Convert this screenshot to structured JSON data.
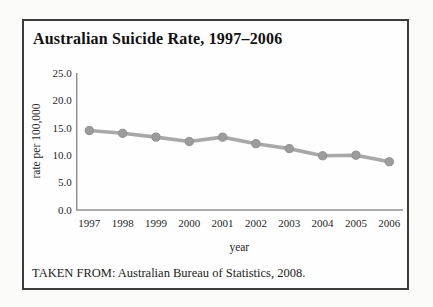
{
  "figure": {
    "title": "Australian Suicide Rate, 1997–2006",
    "caption": "TAKEN FROM: Australian Bureau of Statistics, 2008."
  },
  "chart_data": {
    "type": "line",
    "title": "Australian Suicide Rate, 1997–2006",
    "xlabel": "year",
    "ylabel": "rate per 100,000",
    "categories": [
      "1997",
      "1998",
      "1999",
      "2000",
      "2001",
      "2002",
      "2003",
      "2004",
      "2005",
      "2006"
    ],
    "values": [
      14.5,
      14.0,
      13.3,
      12.5,
      13.3,
      12.1,
      11.2,
      9.9,
      10.0,
      8.8
    ],
    "ylim": [
      0,
      25
    ],
    "yticks": [
      0,
      5,
      10,
      15,
      20,
      25
    ],
    "ytick_labels": [
      "0.0",
      "5.0",
      "10.0",
      "15.0",
      "20.0",
      "25.0"
    ],
    "grid": false,
    "legend": "none",
    "colors": {
      "line": "#a8a8a8",
      "marker": "#9c9c9c",
      "marker_edge": "#8e8e8e",
      "axis": "#8f9193",
      "border": "#3b3b3b",
      "text": "#1e1e1e"
    }
  }
}
